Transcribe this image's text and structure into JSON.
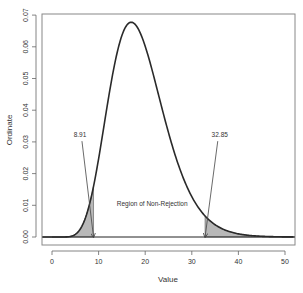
{
  "chart_data": {
    "type": "area",
    "title": "",
    "xlabel": "Value",
    "ylabel": "Ordinate",
    "xlim": [
      -2,
      52
    ],
    "ylim": [
      -0.0025,
      0.0705
    ],
    "x_ticks": [
      0,
      10,
      20,
      30,
      40,
      50
    ],
    "y_ticks": [
      0.0,
      0.01,
      0.02,
      0.03,
      0.04,
      0.05,
      0.06,
      0.07
    ],
    "y_tick_labels": [
      "0.00",
      "0.01",
      "0.02",
      "0.03",
      "0.04",
      "0.05",
      "0.06",
      "0.07"
    ],
    "grid": false,
    "legend": null,
    "distribution": "chi-square",
    "df": 19,
    "curve_peak": {
      "x": 17,
      "y": 0.068
    },
    "critical_values": {
      "lower": 8.91,
      "upper": 32.85
    },
    "shaded_regions": [
      {
        "name": "lower-rejection",
        "from": 0,
        "to": 8.91
      },
      {
        "name": "upper-rejection",
        "from": 32.85,
        "to": 52
      }
    ],
    "annotations": [
      {
        "text": "8.91",
        "label_x": 6.0,
        "label_y": 0.0315,
        "arrow_to_x": 8.91,
        "arrow_to_y": 0.0
      },
      {
        "text": "32.85",
        "label_x": 36.0,
        "label_y": 0.0315,
        "arrow_to_x": 32.85,
        "arrow_to_y": 0.0
      },
      {
        "text": "Region of Non-Rejection",
        "x": 21.5,
        "y": 0.0098
      }
    ],
    "colors": {
      "curve": "#2a2a2a",
      "fill": "#b8b8b8",
      "axis": "#555555",
      "box": "#888888"
    }
  },
  "labels": {
    "xlabel": "Value",
    "ylabel": "Ordinate",
    "lower_cv": "8.91",
    "upper_cv": "32.85",
    "non_rejection": "Region of Non-Rejection"
  }
}
